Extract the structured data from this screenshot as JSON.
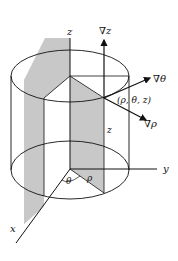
{
  "diagram": {
    "labels": {
      "z_axis": "z",
      "y_axis": "y",
      "x_axis": "x",
      "grad_z": "∇z",
      "grad_theta": "∇θ",
      "grad_rho": "∇ρ",
      "point": "(ρ, θ, z)",
      "height": "z",
      "radius": "ρ",
      "angle": "θ"
    },
    "colors": {
      "line": "#111111",
      "shade": "#c8c8c8",
      "background": "#ffffff"
    }
  }
}
